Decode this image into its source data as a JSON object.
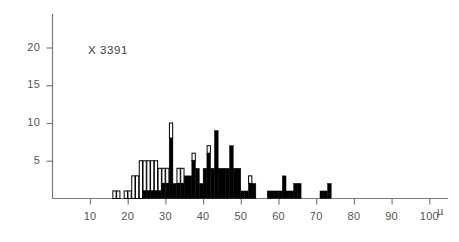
{
  "chart_data": {
    "type": "bar",
    "title": "",
    "subtitle": "",
    "annotation": "X 3391",
    "annotation_parts": {
      "prefix": "X",
      "value": "3391"
    },
    "xlabel": "",
    "ylabel": "",
    "unit": "µ",
    "grid": false,
    "legend": false,
    "legend_position": "none",
    "bin_width": 1,
    "xlim": [
      5,
      102
    ],
    "ylim": [
      0,
      24
    ],
    "x_ticks": [
      10,
      20,
      30,
      40,
      50,
      60,
      70,
      80,
      90,
      100
    ],
    "x_tick_labels": [
      "10",
      "20",
      "30",
      "40",
      "50",
      "60",
      "70",
      "80",
      "90",
      "100"
    ],
    "y_ticks": [
      5,
      10,
      15,
      20
    ],
    "y_tick_labels": [
      "5",
      "10",
      "15",
      "20"
    ],
    "series": [
      {
        "name": "filled",
        "color": "#000000",
        "values": [
          0,
          0,
          0,
          0,
          0,
          0,
          0,
          0,
          0,
          0,
          0,
          1,
          1,
          1,
          2,
          2,
          2,
          4,
          4,
          4,
          2,
          2,
          2,
          1,
          3,
          3,
          3,
          5,
          5,
          5,
          4,
          4,
          4,
          3,
          3,
          3,
          3,
          2,
          2,
          2,
          2,
          2,
          1,
          1,
          1,
          1,
          1,
          0,
          0,
          0,
          0,
          0,
          0,
          0,
          0,
          0,
          0,
          0,
          0,
          0,
          0,
          0,
          0,
          0,
          0
        ]
      },
      {
        "name": "open",
        "color": "#ffffff",
        "values": [
          0,
          0,
          0,
          0,
          0,
          0,
          0,
          0,
          0,
          0,
          0,
          0,
          0,
          0,
          0,
          0,
          0,
          0,
          0,
          0,
          0,
          0,
          0,
          0,
          0,
          0,
          0,
          0,
          0,
          0,
          0,
          0,
          0,
          0,
          0,
          0,
          0,
          0,
          0,
          0,
          0,
          0,
          0,
          0,
          0,
          0,
          0,
          0,
          0,
          0,
          0,
          0,
          0,
          0,
          0,
          0,
          0,
          0,
          0,
          0,
          0,
          0,
          0,
          0,
          0
        ]
      }
    ],
    "bins": [
      {
        "x": 16,
        "black": 0,
        "white": 1
      },
      {
        "x": 17,
        "black": 0,
        "white": 1
      },
      {
        "x": 18,
        "black": 0,
        "white": 0
      },
      {
        "x": 19,
        "black": 0,
        "white": 1
      },
      {
        "x": 20,
        "black": 0,
        "white": 1
      },
      {
        "x": 21,
        "black": 0,
        "white": 3
      },
      {
        "x": 22,
        "black": 0,
        "white": 3
      },
      {
        "x": 23,
        "black": 0,
        "white": 5
      },
      {
        "x": 24,
        "black": 1,
        "white": 4
      },
      {
        "x": 25,
        "black": 1,
        "white": 4
      },
      {
        "x": 26,
        "black": 1,
        "white": 4
      },
      {
        "x": 27,
        "black": 1,
        "white": 4
      },
      {
        "x": 28,
        "black": 1,
        "white": 3
      },
      {
        "x": 29,
        "black": 2,
        "white": 2
      },
      {
        "x": 30,
        "black": 2,
        "white": 2
      },
      {
        "x": 31,
        "black": 8,
        "white": 2
      },
      {
        "x": 32,
        "black": 2,
        "white": 0
      },
      {
        "x": 33,
        "black": 2,
        "white": 2
      },
      {
        "x": 34,
        "black": 2,
        "white": 2
      },
      {
        "x": 35,
        "black": 3,
        "white": 0
      },
      {
        "x": 36,
        "black": 3,
        "white": 0
      },
      {
        "x": 37,
        "black": 5,
        "white": 1
      },
      {
        "x": 38,
        "black": 4,
        "white": 0
      },
      {
        "x": 39,
        "black": 2,
        "white": 0
      },
      {
        "x": 40,
        "black": 4,
        "white": 0
      },
      {
        "x": 41,
        "black": 6,
        "white": 1
      },
      {
        "x": 42,
        "black": 4,
        "white": 0
      },
      {
        "x": 43,
        "black": 9,
        "white": 0
      },
      {
        "x": 44,
        "black": 4,
        "white": 0
      },
      {
        "x": 45,
        "black": 4,
        "white": 0
      },
      {
        "x": 46,
        "black": 4,
        "white": 0
      },
      {
        "x": 47,
        "black": 7,
        "white": 0
      },
      {
        "x": 48,
        "black": 4,
        "white": 0
      },
      {
        "x": 49,
        "black": 4,
        "white": 0
      },
      {
        "x": 50,
        "black": 1,
        "white": 0
      },
      {
        "x": 51,
        "black": 1,
        "white": 0
      },
      {
        "x": 52,
        "black": 2,
        "white": 1
      },
      {
        "x": 53,
        "black": 2,
        "white": 0
      },
      {
        "x": 54,
        "black": 0,
        "white": 0
      },
      {
        "x": 55,
        "black": 0,
        "white": 0
      },
      {
        "x": 56,
        "black": 0,
        "white": 0
      },
      {
        "x": 57,
        "black": 1,
        "white": 0
      },
      {
        "x": 58,
        "black": 1,
        "white": 0
      },
      {
        "x": 59,
        "black": 1,
        "white": 0
      },
      {
        "x": 60,
        "black": 1,
        "white": 0
      },
      {
        "x": 61,
        "black": 3,
        "white": 0
      },
      {
        "x": 62,
        "black": 1,
        "white": 0
      },
      {
        "x": 63,
        "black": 1,
        "white": 0
      },
      {
        "x": 64,
        "black": 2,
        "white": 0
      },
      {
        "x": 65,
        "black": 2,
        "white": 0
      },
      {
        "x": 66,
        "black": 0,
        "white": 0
      },
      {
        "x": 67,
        "black": 0,
        "white": 0
      },
      {
        "x": 68,
        "black": 0,
        "white": 0
      },
      {
        "x": 69,
        "black": 0,
        "white": 0
      },
      {
        "x": 70,
        "black": 0,
        "white": 0
      },
      {
        "x": 71,
        "black": 1,
        "white": 0
      },
      {
        "x": 72,
        "black": 1,
        "white": 0
      },
      {
        "x": 73,
        "black": 2,
        "white": 0
      },
      {
        "x": 74,
        "black": 0,
        "white": 0
      }
    ]
  },
  "axis": {
    "y_unit": "",
    "x_unit": "µ"
  }
}
